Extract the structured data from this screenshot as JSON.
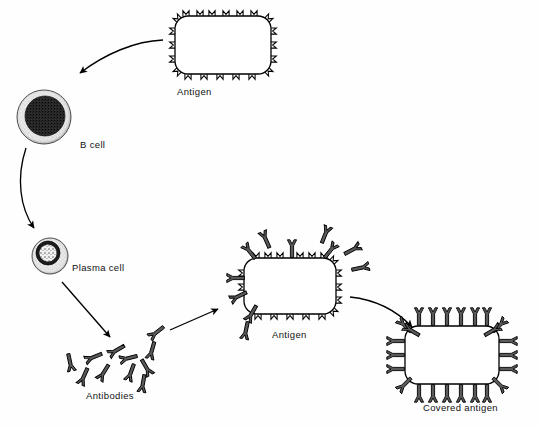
{
  "diagram": {
    "background_color": "#fefefe",
    "ink_color": "#000000",
    "antibody_fill": "#5a5a5a",
    "labels": {
      "antigen_top": "Antigen",
      "b_cell": "B cell",
      "plasma_cell": "Plasma cell",
      "antibodies": "Antibodies",
      "antigen_middle": "Antigen",
      "covered_antigen": "Covered antigen"
    },
    "nodes": [
      {
        "id": "antigen-top",
        "name": "antigen",
        "label": "Antigen",
        "shape": "rounded-rectangle-with-m-markers",
        "x": 223,
        "y": 45,
        "width": 95,
        "height": 58,
        "marker_glyph": "M",
        "marker_count": 20,
        "bound_antibodies": 0
      },
      {
        "id": "b-cell",
        "name": "b-cell",
        "label": "B cell",
        "shape": "stippled-circle-with-dark-nucleus",
        "x": 44,
        "y": 117,
        "radius": 27,
        "nucleus_radius": 20,
        "nucleus_tone": "dark-dense-stipple",
        "cytoplasm_tone": "light-stipple"
      },
      {
        "id": "plasma-cell",
        "name": "plasma-cell",
        "label": "Plasma cell",
        "shape": "small-circle-with-light-patterned-nucleus",
        "x": 50,
        "y": 256,
        "radius": 18,
        "nucleus_radius": 12,
        "nucleus_tone": "dark-ring-light-star-interior",
        "cytoplasm_tone": "light-stipple"
      },
      {
        "id": "antibody-cloud",
        "name": "antibodies",
        "label": "Antibodies",
        "shape": "scattered-y-shaped-antibodies",
        "x": 130,
        "y": 355,
        "count": 11
      },
      {
        "id": "antigen-middle",
        "name": "antigen-under-attack",
        "label": "Antigen",
        "shape": "rounded-rectangle-with-m-markers",
        "x": 290,
        "y": 285,
        "width": 92,
        "height": 56,
        "marker_glyph": "M",
        "marker_count": 20,
        "bound_antibodies": 6,
        "free_antibodies_nearby": 5
      },
      {
        "id": "covered-antigen",
        "name": "covered-antigen",
        "label": "Covered antigen",
        "shape": "rounded-rectangle-fully-coated",
        "x": 452,
        "y": 355,
        "width": 94,
        "height": 58,
        "bound_antibodies": 24
      }
    ],
    "arrows": [
      {
        "id": "arrow-antigen-to-bcell",
        "name": "arrow-antigen-to-b-cell",
        "from": "antigen-top",
        "to": "b-cell",
        "style": "curved",
        "direction": "down-left"
      },
      {
        "id": "arrow-bcell-to-plasma",
        "name": "arrow-b-cell-to-plasma-cell",
        "from": "b-cell",
        "to": "plasma-cell",
        "style": "curved",
        "direction": "down"
      },
      {
        "id": "arrow-plasma-to-antibodies",
        "name": "arrow-plasma-cell-to-antibodies",
        "from": "plasma-cell",
        "to": "antibody-cloud",
        "style": "straight",
        "direction": "down-right"
      },
      {
        "id": "arrow-antibodies-to-antigen",
        "name": "arrow-antibodies-to-antigen",
        "from": "antibody-cloud",
        "to": "antigen-middle",
        "style": "straight",
        "direction": "right"
      },
      {
        "id": "arrow-antigen-to-covered",
        "name": "arrow-antigen-to-covered-antigen",
        "from": "antigen-middle",
        "to": "covered-antigen",
        "style": "curved",
        "direction": "down-right"
      }
    ]
  }
}
